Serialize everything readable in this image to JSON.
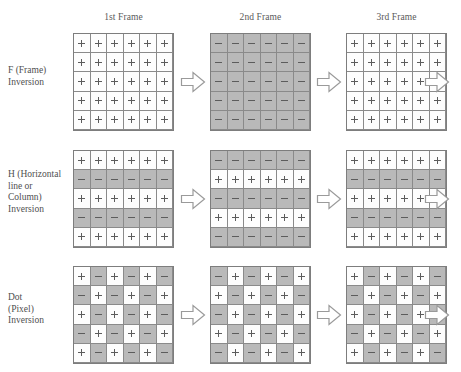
{
  "headers": [
    {
      "label": "1st Frame"
    },
    {
      "label": "2nd Frame"
    },
    {
      "label": "3rd Frame"
    }
  ],
  "colors": {
    "positive_cell": "#fdfdfd",
    "negative_cell": "#b9b9b9",
    "grid_line": "#8a8a8a",
    "symbol": "#5c5c5c",
    "arrow_outline": "#9a9a9a",
    "text": "#4f4f4f",
    "background": "#ffffff"
  },
  "symbols": {
    "positive": "+",
    "negative": "-"
  },
  "grid_size": {
    "columns": 6,
    "rows": 5
  },
  "arrow_icon": "right-block-arrow",
  "bottom_caption": "",
  "rows": [
    {
      "id": "frame-inversion",
      "label": "F (Frame)\nInversion",
      "label_lines": [
        "F (Frame)",
        "Inversion"
      ],
      "frames": [
        {
          "name": "1st Frame",
          "polarity": [
            [
              "+",
              "+",
              "+",
              "+",
              "+",
              "+"
            ],
            [
              "+",
              "+",
              "+",
              "+",
              "+",
              "+"
            ],
            [
              "+",
              "+",
              "+",
              "+",
              "+",
              "+"
            ],
            [
              "+",
              "+",
              "+",
              "+",
              "+",
              "+"
            ],
            [
              "+",
              "+",
              "+",
              "+",
              "+",
              "+"
            ]
          ]
        },
        {
          "name": "2nd Frame",
          "polarity": [
            [
              "-",
              "-",
              "-",
              "-",
              "-",
              "-"
            ],
            [
              "-",
              "-",
              "-",
              "-",
              "-",
              "-"
            ],
            [
              "-",
              "-",
              "-",
              "-",
              "-",
              "-"
            ],
            [
              "-",
              "-",
              "-",
              "-",
              "-",
              "-"
            ],
            [
              "-",
              "-",
              "-",
              "-",
              "-",
              "-"
            ]
          ]
        },
        {
          "name": "3rd Frame",
          "polarity": [
            [
              "+",
              "+",
              "+",
              "+",
              "+",
              "+"
            ],
            [
              "+",
              "+",
              "+",
              "+",
              "+",
              "+"
            ],
            [
              "+",
              "+",
              "+",
              "+",
              "+",
              "+"
            ],
            [
              "+",
              "+",
              "+",
              "+",
              "+",
              "+"
            ],
            [
              "+",
              "+",
              "+",
              "+",
              "+",
              "+"
            ]
          ]
        }
      ]
    },
    {
      "id": "horizontal-line-column-inversion",
      "label": "H (Horizontal line or Column) Inversion",
      "label_lines": [
        "H (Horizontal",
        "line or",
        "Column)",
        "Inversion"
      ],
      "frames": [
        {
          "name": "1st Frame",
          "polarity": [
            [
              "+",
              "+",
              "+",
              "+",
              "+",
              "+"
            ],
            [
              "-",
              "-",
              "-",
              "-",
              "-",
              "-"
            ],
            [
              "+",
              "+",
              "+",
              "+",
              "+",
              "+"
            ],
            [
              "-",
              "-",
              "-",
              "-",
              "-",
              "-"
            ],
            [
              "+",
              "+",
              "+",
              "+",
              "+",
              "+"
            ]
          ]
        },
        {
          "name": "2nd Frame",
          "polarity": [
            [
              "-",
              "-",
              "-",
              "-",
              "-",
              "-"
            ],
            [
              "+",
              "+",
              "+",
              "+",
              "+",
              "+"
            ],
            [
              "-",
              "-",
              "-",
              "-",
              "-",
              "-"
            ],
            [
              "+",
              "+",
              "+",
              "+",
              "+",
              "+"
            ],
            [
              "-",
              "-",
              "-",
              "-",
              "-",
              "-"
            ]
          ]
        },
        {
          "name": "3rd Frame",
          "polarity": [
            [
              "+",
              "+",
              "+",
              "+",
              "+",
              "+"
            ],
            [
              "-",
              "-",
              "-",
              "-",
              "-",
              "-"
            ],
            [
              "+",
              "+",
              "+",
              "+",
              "+",
              "+"
            ],
            [
              "-",
              "-",
              "-",
              "-",
              "-",
              "-"
            ],
            [
              "+",
              "+",
              "+",
              "+",
              "+",
              "+"
            ]
          ]
        }
      ]
    },
    {
      "id": "dot-pixel-inversion",
      "label": "Dot (Pixel) Inversion",
      "label_lines": [
        "Dot",
        "(Pixel)",
        "Inversion"
      ],
      "frames": [
        {
          "name": "1st Frame",
          "polarity": [
            [
              "+",
              "-",
              "+",
              "-",
              "+",
              "-"
            ],
            [
              "-",
              "+",
              "-",
              "+",
              "-",
              "+"
            ],
            [
              "+",
              "-",
              "+",
              "-",
              "+",
              "-"
            ],
            [
              "-",
              "+",
              "-",
              "+",
              "-",
              "+"
            ],
            [
              "+",
              "-",
              "+",
              "-",
              "+",
              "-"
            ]
          ]
        },
        {
          "name": "2nd Frame",
          "polarity": [
            [
              "-",
              "+",
              "-",
              "+",
              "-",
              "+"
            ],
            [
              "+",
              "-",
              "+",
              "-",
              "+",
              "-"
            ],
            [
              "-",
              "+",
              "-",
              "+",
              "-",
              "+"
            ],
            [
              "+",
              "-",
              "+",
              "-",
              "+",
              "-"
            ],
            [
              "-",
              "+",
              "-",
              "+",
              "-",
              "+"
            ]
          ]
        },
        {
          "name": "3rd Frame",
          "polarity": [
            [
              "+",
              "-",
              "+",
              "-",
              "+",
              "-"
            ],
            [
              "-",
              "+",
              "-",
              "+",
              "-",
              "+"
            ],
            [
              "+",
              "-",
              "+",
              "-",
              "+",
              "-"
            ],
            [
              "-",
              "+",
              "-",
              "+",
              "-",
              "+"
            ],
            [
              "+",
              "-",
              "+",
              "-",
              "+",
              "-"
            ]
          ]
        }
      ]
    }
  ]
}
